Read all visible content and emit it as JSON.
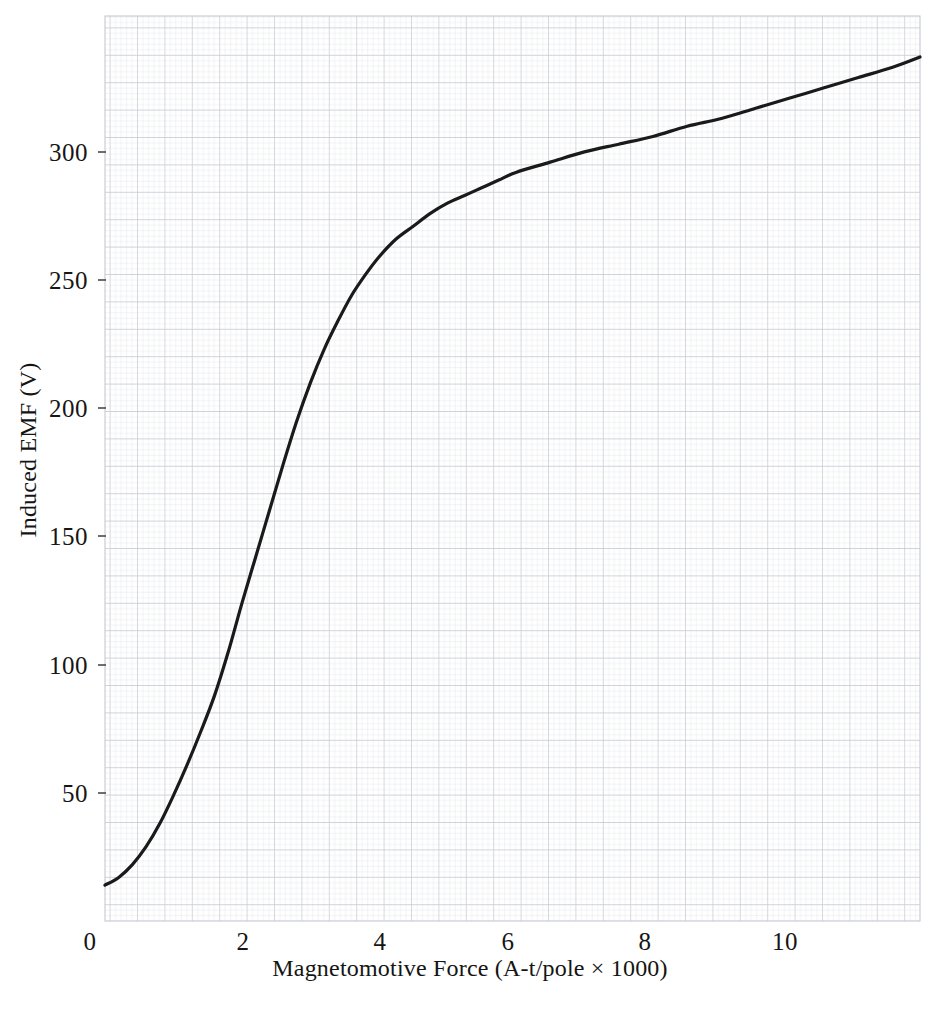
{
  "figure": {
    "background_color": "#ffffff",
    "grid_paper": {
      "minor_color": "#e2e3e8",
      "major_color": "#c9cbd4",
      "minor_step_px": 5.48,
      "major_every": 5
    },
    "plot_area": {
      "left_px": 105,
      "right_px": 920,
      "top_px": 16,
      "bottom_px": 921
    }
  },
  "chart_data": {
    "type": "line",
    "title": "",
    "xlabel": "Magnetomotive Force (A-t/pole × 1000)",
    "ylabel": "Induced EMF (V)",
    "xlim": [
      0,
      11.9
    ],
    "ylim": [
      0,
      353
    ],
    "xticks": [
      0,
      2,
      4,
      6,
      8,
      10
    ],
    "xtick_labels": [
      "0",
      "2",
      "4",
      "6",
      "8",
      "10"
    ],
    "yticks": [
      50,
      100,
      150,
      200,
      250,
      300
    ],
    "ytick_labels": [
      "50",
      "100",
      "150",
      "200",
      "250",
      "300"
    ],
    "grid": true,
    "grid_style": "engineering graph paper, minor squares with darker every 5th line",
    "legend": null,
    "series": [
      {
        "name": "Magnetization (saturation) curve",
        "color": "#1a1a1a",
        "line_width_px": 3.2,
        "x": [
          0.0,
          0.2,
          0.4,
          0.6,
          0.8,
          1.0,
          1.2,
          1.4,
          1.6,
          1.8,
          2.0,
          2.2,
          2.4,
          2.6,
          2.8,
          3.0,
          3.2,
          3.4,
          3.6,
          3.8,
          4.0,
          4.25,
          4.5,
          4.75,
          5.0,
          5.25,
          5.5,
          5.75,
          6.0,
          6.5,
          7.0,
          7.5,
          8.0,
          8.5,
          9.0,
          9.5,
          10.0,
          10.5,
          11.0,
          11.5,
          11.9
        ],
        "y": [
          14,
          17,
          22,
          29,
          38,
          49,
          61,
          74,
          88,
          105,
          124,
          142,
          160,
          178,
          195,
          210,
          223,
          234,
          244,
          252,
          259,
          266,
          271,
          276,
          280,
          283,
          286,
          289,
          292,
          296,
          300,
          303,
          306,
          310,
          313,
          317,
          321,
          325,
          329,
          333,
          337
        ]
      }
    ],
    "annotations": []
  },
  "axis_ticks": {
    "x": [
      {
        "label": "0",
        "value": 0,
        "px": 105
      },
      {
        "label": "2",
        "value": 2,
        "px": 242
      },
      {
        "label": "4",
        "value": 4,
        "px": 379
      },
      {
        "label": "6",
        "value": 6,
        "px": 515
      },
      {
        "label": "8",
        "value": 8,
        "px": 652
      },
      {
        "label": "10",
        "value": 10,
        "px": 789
      }
    ],
    "y": [
      {
        "label": "50",
        "value": 50,
        "px": 793
      },
      {
        "label": "100",
        "value": 100,
        "px": 665
      },
      {
        "label": "150",
        "value": 150,
        "px": 536
      },
      {
        "label": "200",
        "value": 200,
        "px": 408
      },
      {
        "label": "250",
        "value": 250,
        "px": 280
      },
      {
        "label": "300",
        "value": 300,
        "px": 152
      }
    ]
  }
}
